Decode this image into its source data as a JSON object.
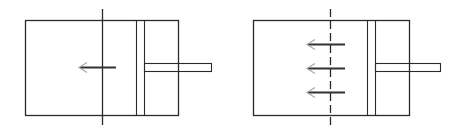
{
  "diagram": {
    "type": "piston-cylinder comparison",
    "colors": {
      "line": "#2a2a2a",
      "arrow_shaft": "#333333",
      "arrow_head": "#a8a8a8",
      "background": "#ffffff"
    },
    "panels": [
      {
        "id": "left",
        "cylinder": {
          "x": 25,
          "y": 20,
          "w": 153,
          "h": 95
        },
        "piston": {
          "x1": 136,
          "x2": 144
        },
        "rod": {
          "x1": 144,
          "x2": 211,
          "y1": 63,
          "y2": 71
        },
        "axis_line": {
          "x": 102,
          "y1": 9,
          "y2": 125,
          "style": "solid"
        },
        "arrows": [
          {
            "y": 67,
            "x_tail": 116,
            "x_head": 79
          }
        ]
      },
      {
        "id": "right",
        "cylinder": {
          "x": 253,
          "y": 20,
          "w": 156,
          "h": 95
        },
        "piston": {
          "x1": 367,
          "x2": 375
        },
        "rod": {
          "x1": 375,
          "x2": 440,
          "y1": 63,
          "y2": 71
        },
        "axis_line": {
          "x": 330,
          "y1": 9,
          "y2": 127,
          "style": "dashed"
        },
        "arrows": [
          {
            "y": 44,
            "x_tail": 345,
            "x_head": 307
          },
          {
            "y": 68,
            "x_tail": 345,
            "x_head": 307
          },
          {
            "y": 92,
            "x_tail": 345,
            "x_head": 307
          }
        ]
      }
    ]
  }
}
